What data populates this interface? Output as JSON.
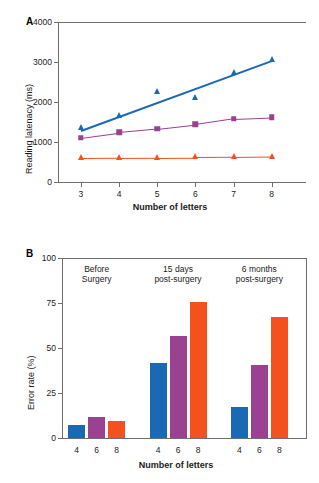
{
  "figure": {
    "panel_a_letter": "A",
    "panel_b_letter": "B"
  },
  "chart_data": [
    {
      "type": "line",
      "panel": "A",
      "title": "",
      "xlabel": "Number of letters",
      "ylabel": "Reading latenacy (ms)",
      "x": [
        3,
        4,
        5,
        6,
        7,
        8
      ],
      "xlim": [
        2.4,
        8.9
      ],
      "ylim": [
        0,
        4000
      ],
      "xticks": [
        3,
        4,
        5,
        6,
        7,
        8
      ],
      "yticks": [
        0,
        1000,
        2000,
        3000,
        4000
      ],
      "xtick_labels": [
        "3",
        "4",
        "5",
        "6",
        "7",
        "8"
      ],
      "ytick_labels": [
        "0",
        "1000",
        "2000",
        "3000",
        "4000"
      ],
      "grid": false,
      "legend": "none",
      "series": [
        {
          "name": "blue-triangles",
          "marker": "triangle",
          "color": "#1B69B4",
          "values": [
            1340,
            1650,
            2260,
            2110,
            2730,
            3050
          ],
          "fit_line": {
            "y_start": 1310,
            "y_end": 3060
          }
        },
        {
          "name": "purple-squares",
          "marker": "square",
          "color": "#9B4191",
          "values": [
            1110,
            1240,
            1330,
            1440,
            1580,
            1620
          ]
        },
        {
          "name": "orange-triangles",
          "marker": "triangle",
          "color": "#F4511E",
          "values": [
            600,
            605,
            610,
            615,
            620,
            635
          ]
        }
      ]
    },
    {
      "type": "bar",
      "panel": "B",
      "title": "",
      "xlabel": "Number of letters",
      "ylabel": "Error rate (%)",
      "ylim": [
        0,
        100
      ],
      "yticks": [
        0,
        25,
        50,
        75,
        100
      ],
      "ytick_labels": [
        "0",
        "25",
        "50",
        "75",
        "100"
      ],
      "grid": false,
      "legend": "none",
      "groups": [
        {
          "label_line1": "Before",
          "label_line2": "Surgery",
          "categories": [
            "4",
            "6",
            "8"
          ],
          "values": [
            7.5,
            11.5,
            9.5
          ],
          "colors": [
            "#1B69B4",
            "#9B4191",
            "#F4511E"
          ]
        },
        {
          "label_line1": "15 days",
          "label_line2": "post-surgery",
          "categories": [
            "4",
            "6",
            "8"
          ],
          "values": [
            41.5,
            56.5,
            75.5
          ],
          "colors": [
            "#1B69B4",
            "#9B4191",
            "#F4511E"
          ]
        },
        {
          "label_line1": "6 months",
          "label_line2": "post-surgery",
          "categories": [
            "4",
            "6",
            "8"
          ],
          "values": [
            17.5,
            40.5,
            67.0
          ],
          "colors": [
            "#1B69B4",
            "#9B4191",
            "#F4511E"
          ]
        }
      ]
    }
  ]
}
